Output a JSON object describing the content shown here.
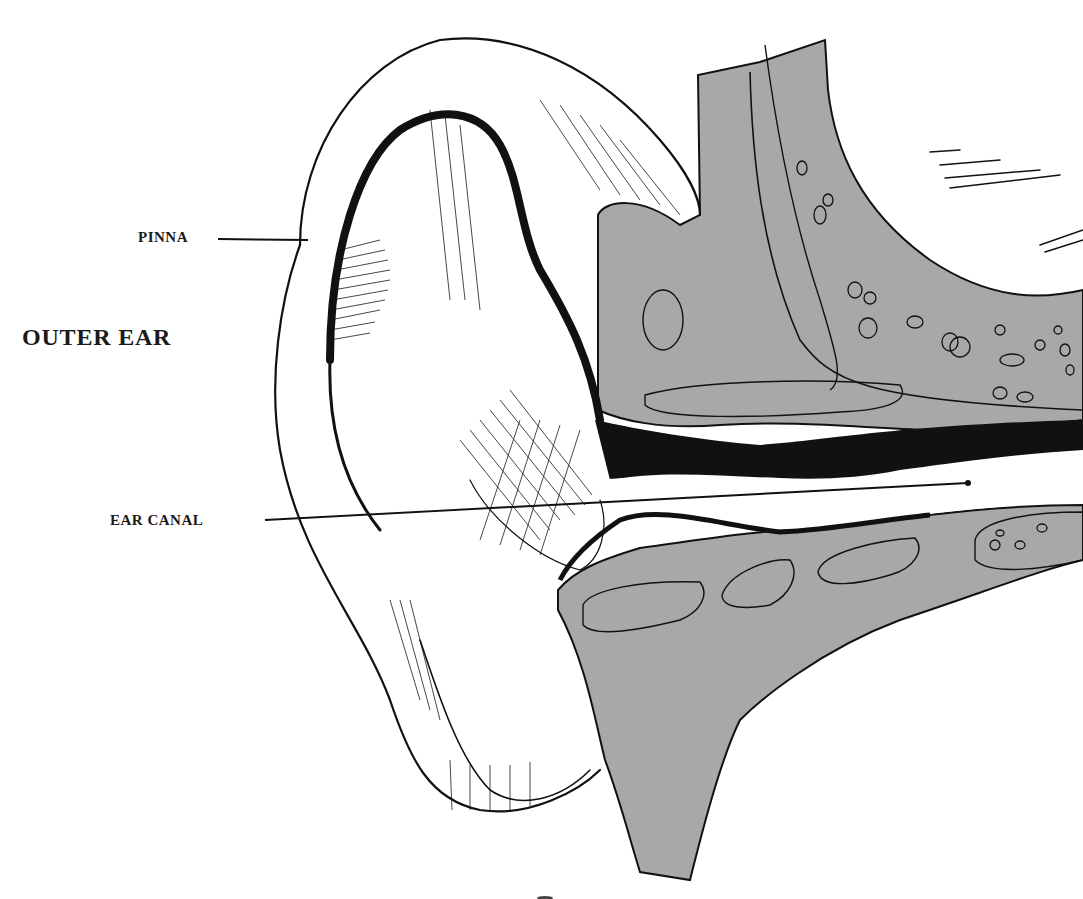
{
  "diagram": {
    "title": "OUTER EAR",
    "labels": [
      {
        "id": "pinna",
        "text": "PINNA",
        "x": 138,
        "y": 229
      },
      {
        "id": "ear-canal",
        "text": "EAR CANAL",
        "x": 110,
        "y": 512
      }
    ],
    "section_heading": {
      "text": "OUTER EAR",
      "x": 22,
      "y": 324
    },
    "colors": {
      "ink": "#111111",
      "bone": "#a8a8a8",
      "paper": "#ffffff"
    }
  }
}
